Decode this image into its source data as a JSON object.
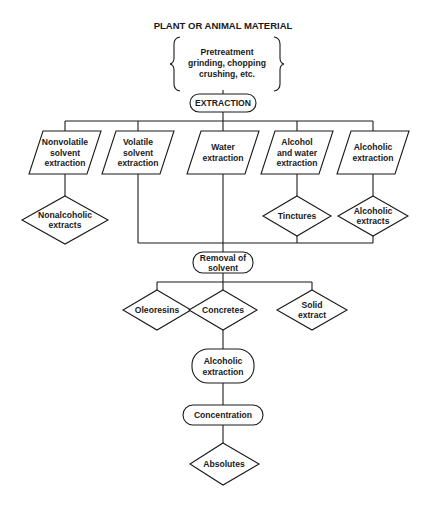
{
  "diagram": {
    "title": "PLANT OR ANIMAL MATERIAL",
    "pretreatment": [
      "Pretreatment",
      "grinding, chopping",
      "crushing, etc."
    ],
    "extraction": "EXTRACTION",
    "methods": [
      {
        "lines": [
          "Nonvolatile",
          "solvent",
          "extraction"
        ]
      },
      {
        "lines": [
          "Volatile",
          "solvent",
          "extraction"
        ]
      },
      {
        "lines": [
          "Water",
          "extraction"
        ]
      },
      {
        "lines": [
          "Alcohol",
          "and water",
          "extraction"
        ]
      },
      {
        "lines": [
          "Alcoholic",
          "extraction"
        ]
      }
    ],
    "method_products": [
      {
        "lines": [
          "Nonalcoholic",
          "extracts"
        ]
      },
      {
        "lines": [
          "Tinctures"
        ]
      },
      {
        "lines": [
          "Alcoholic",
          "extracts"
        ]
      }
    ],
    "removal": [
      "Removal of",
      "solvent"
    ],
    "solvent_products": [
      {
        "lines": [
          "Oleoresins"
        ]
      },
      {
        "lines": [
          "Concretes"
        ]
      },
      {
        "lines": [
          "Solid",
          "extract"
        ]
      }
    ],
    "alcoholic_extraction": [
      "Alcoholic",
      "extraction"
    ],
    "concentration": "Concentration",
    "absolutes": "Absolutes"
  }
}
